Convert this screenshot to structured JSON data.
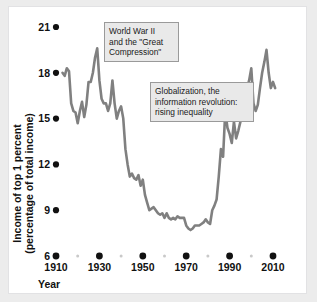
{
  "figure": {
    "background_color": "#ececec",
    "panel_color": "#ffffff",
    "line_color": "#808080",
    "marker_color": "#111111",
    "annotation_fill": "#e9e9e9",
    "annotation_border": "#9a9a9a"
  },
  "annotations": [
    {
      "name": "world-war-two-great-compression",
      "lines": [
        "World War II",
        "and the \"Great",
        "Compression\""
      ],
      "text": "World War II and the \"Great Compression\"",
      "x_data": 1932,
      "y_data": 20.2
    },
    {
      "name": "globalization-information-revolution",
      "lines": [
        "Globalization, the",
        "information revolution:",
        "rising inequality"
      ],
      "text": "Globalization, the information revolution: rising inequality",
      "x_data": 1954,
      "y_data": 16.6
    }
  ],
  "chart_data": {
    "type": "line",
    "title": "",
    "xlabel": "Year",
    "ylabel": "Income of top 1 percent (percentage of total income)",
    "ylabel_lines": [
      "Income of top 1 percent",
      "(percentage of total income)"
    ],
    "xlim": [
      1910,
      2012
    ],
    "ylim": [
      6,
      21
    ],
    "grid": false,
    "legend": null,
    "yticks": [
      6,
      9,
      12,
      15,
      18,
      21
    ],
    "ytick_labels": [
      "6",
      "9",
      "12",
      "15",
      "18",
      "21"
    ],
    "xticks": [
      1910,
      1930,
      1950,
      1970,
      1990,
      2010
    ],
    "xtick_labels": [
      "1910",
      "1930",
      "1950",
      "1970",
      "1990",
      "2010"
    ],
    "xticks_minor": [
      1920,
      1940,
      1960,
      1980,
      2000
    ],
    "tick_marker_style": "filled-circle",
    "series": [
      {
        "name": "Income share of top 1 percent",
        "x": [
          1913,
          1914,
          1915,
          1916,
          1917,
          1918,
          1919,
          1920,
          1921,
          1922,
          1923,
          1924,
          1925,
          1926,
          1927,
          1928,
          1929,
          1930,
          1931,
          1932,
          1933,
          1934,
          1935,
          1936,
          1937,
          1938,
          1939,
          1940,
          1941,
          1942,
          1943,
          1944,
          1945,
          1946,
          1947,
          1948,
          1949,
          1950,
          1951,
          1952,
          1953,
          1954,
          1955,
          1956,
          1957,
          1958,
          1959,
          1960,
          1961,
          1962,
          1963,
          1964,
          1965,
          1966,
          1967,
          1968,
          1969,
          1970,
          1971,
          1972,
          1973,
          1974,
          1975,
          1976,
          1977,
          1978,
          1979,
          1980,
          1981,
          1982,
          1983,
          1984,
          1985,
          1986,
          1987,
          1988,
          1989,
          1990,
          1991,
          1992,
          1993,
          1994,
          1995,
          1996,
          1997,
          1998,
          1999,
          2000,
          2001,
          2002,
          2003,
          2004,
          2005,
          2006,
          2007,
          2008,
          2009,
          2010,
          2011
        ],
        "values": [
          18.0,
          17.8,
          18.3,
          18.1,
          16.0,
          15.5,
          15.4,
          14.7,
          15.5,
          16.1,
          15.1,
          15.9,
          17.4,
          17.4,
          18.0,
          19.0,
          19.6,
          17.5,
          16.3,
          16.0,
          16.0,
          15.5,
          16.0,
          17.5,
          16.0,
          15.0,
          15.5,
          15.8,
          15.0,
          13.0,
          12.0,
          11.2,
          11.4,
          11.1,
          11.0,
          11.3,
          10.6,
          11.0,
          10.0,
          9.5,
          9.0,
          9.1,
          9.2,
          9.0,
          8.8,
          8.7,
          8.8,
          8.5,
          8.8,
          8.5,
          8.4,
          8.5,
          8.4,
          8.6,
          8.5,
          8.5,
          8.5,
          8.0,
          7.8,
          7.7,
          7.8,
          8.0,
          8.0,
          8.0,
          8.1,
          8.2,
          8.4,
          8.2,
          8.1,
          9.0,
          9.3,
          9.7,
          11.2,
          13.0,
          12.5,
          15.5,
          14.4,
          14.0,
          13.4,
          14.8,
          13.7,
          14.2,
          14.8,
          16.2,
          16.6,
          17.0,
          17.5,
          18.3,
          16.0,
          15.5,
          15.9,
          17.0,
          18.0,
          18.7,
          19.5,
          18.0,
          17.0,
          17.4,
          17.0
        ],
        "line_width": 2.6
      }
    ]
  }
}
